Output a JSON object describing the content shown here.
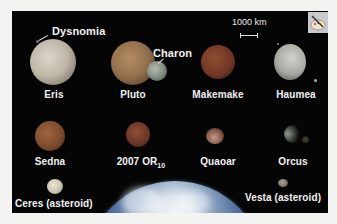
{
  "figure": {
    "background_color": "#f3f3f1",
    "panel_color": "#050505",
    "scale_bar": {
      "label": "1000 km"
    },
    "icon": "palette-icon"
  },
  "bodies": {
    "eris": {
      "name": "Eris",
      "color": "#c9c2b4"
    },
    "dysnomia": {
      "name": "Dysnomia"
    },
    "pluto": {
      "name": "Pluto",
      "color": "#a07a52"
    },
    "charon": {
      "name": "Charon",
      "color": "#8f9a8e"
    },
    "makemake": {
      "name": "Makemake",
      "color": "#7a3f2a"
    },
    "haumea": {
      "name": "Haumea",
      "color": "#b8b8b2"
    },
    "sedna": {
      "name": "Sedna",
      "color": "#8a5535"
    },
    "or10": {
      "name": "2007 OR",
      "subscript": "10",
      "color": "#7e4230"
    },
    "quaoar": {
      "name": "Quaoar",
      "color": "#9a7060"
    },
    "orcus": {
      "name": "Orcus",
      "color": "#6c7468"
    },
    "ceres": {
      "name": "Ceres (asteroid)",
      "color": "#d9d2c0"
    },
    "vesta": {
      "name": "Vesta (asteroid)",
      "color": "#8c857a"
    },
    "earth": {
      "color": "#3d5f8f"
    }
  }
}
